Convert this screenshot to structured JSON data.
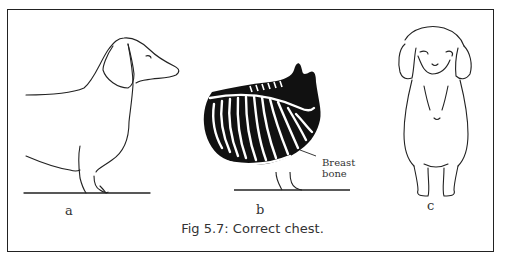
{
  "figure": {
    "caption": "Fig 5.7: Correct chest.",
    "panels": [
      {
        "id": "a",
        "label": "a",
        "description": "Dachshund side view outline"
      },
      {
        "id": "b",
        "label": "b",
        "description": "Ribcage skeleton side view",
        "annotation": {
          "line1": "Breast",
          "line2": "bone"
        }
      },
      {
        "id": "c",
        "label": "c",
        "description": "Dachshund front view outline"
      }
    ]
  },
  "colors": {
    "line": "#222222",
    "background": "#ffffff"
  }
}
